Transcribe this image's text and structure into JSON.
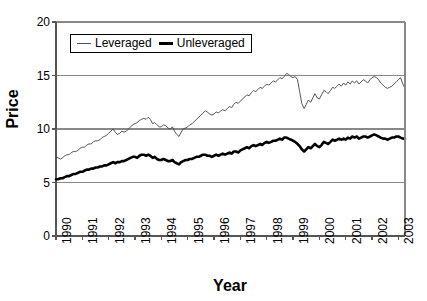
{
  "chart_data": {
    "type": "line",
    "title": "",
    "xlabel": "Year",
    "ylabel": "Price",
    "ylim": [
      0,
      20
    ],
    "yticks": [
      0,
      5,
      10,
      15,
      20
    ],
    "xlim": [
      1990,
      2003.25
    ],
    "xticks": [
      1990,
      1991,
      1992,
      1993,
      1994,
      1995,
      1996,
      1997,
      1998,
      1999,
      2000,
      2001,
      2002,
      2003
    ],
    "xtick_labels": [
      "1990",
      "1991",
      "1992",
      "1993",
      "1994",
      "1995",
      "1996",
      "1997",
      "1998",
      "1999",
      "2000",
      "2001",
      "2002",
      "2003"
    ],
    "grid": "horizontal",
    "legend_position": "top-left-inside",
    "legend_entries": [
      "Leveraged",
      "Unleveraged"
    ],
    "colors": {
      "leveraged": "#444444",
      "unleveraged": "#000000",
      "gridline": "#888888",
      "axis": "#555555",
      "background": "#ffffff"
    },
    "series": [
      {
        "name": "Leveraged",
        "style": "thin",
        "x": [
          1990.0,
          1990.08,
          1990.17,
          1990.25,
          1990.33,
          1990.42,
          1990.5,
          1990.58,
          1990.67,
          1990.75,
          1990.83,
          1990.92,
          1991.0,
          1991.08,
          1991.17,
          1991.25,
          1991.33,
          1991.42,
          1991.5,
          1991.58,
          1991.67,
          1991.75,
          1991.83,
          1991.92,
          1992.0,
          1992.08,
          1992.17,
          1992.25,
          1992.33,
          1992.42,
          1992.5,
          1992.58,
          1992.67,
          1992.75,
          1992.83,
          1992.92,
          1993.0,
          1993.08,
          1993.17,
          1993.25,
          1993.33,
          1993.42,
          1993.5,
          1993.58,
          1993.67,
          1993.75,
          1993.83,
          1993.92,
          1994.0,
          1994.08,
          1994.17,
          1994.25,
          1994.33,
          1994.42,
          1994.5,
          1994.58,
          1994.67,
          1994.75,
          1994.83,
          1994.92,
          1995.0,
          1995.08,
          1995.17,
          1995.25,
          1995.33,
          1995.42,
          1995.5,
          1995.58,
          1995.67,
          1995.75,
          1995.83,
          1995.92,
          1996.0,
          1996.08,
          1996.17,
          1996.25,
          1996.33,
          1996.42,
          1996.5,
          1996.58,
          1996.67,
          1996.75,
          1996.83,
          1996.92,
          1997.0,
          1997.08,
          1997.17,
          1997.25,
          1997.33,
          1997.42,
          1997.5,
          1997.58,
          1997.67,
          1997.75,
          1997.83,
          1997.92,
          1998.0,
          1998.08,
          1998.17,
          1998.25,
          1998.33,
          1998.42,
          1998.5,
          1998.58,
          1998.67,
          1998.75,
          1998.83,
          1998.92,
          1999.0,
          1999.08,
          1999.17,
          1999.25,
          1999.33,
          1999.42,
          1999.5,
          1999.58,
          1999.67,
          1999.75,
          1999.83,
          1999.92,
          2000.0,
          2000.08,
          2000.17,
          2000.25,
          2000.33,
          2000.42,
          2000.5,
          2000.58,
          2000.67,
          2000.75,
          2000.83,
          2000.92,
          2001.0,
          2001.08,
          2001.17,
          2001.25,
          2001.33,
          2001.42,
          2001.5,
          2001.58,
          2001.67,
          2001.75,
          2001.83,
          2001.92,
          2002.0,
          2002.08,
          2002.17,
          2002.25,
          2002.33,
          2002.42,
          2002.5,
          2002.58,
          2002.67,
          2002.75,
          2002.83,
          2002.92,
          2003.0,
          2003.08,
          2003.17,
          2003.25
        ],
        "y": [
          7.4,
          7.3,
          7.2,
          7.3,
          7.5,
          7.6,
          7.6,
          7.8,
          7.9,
          7.9,
          8.0,
          8.2,
          8.3,
          8.3,
          8.5,
          8.6,
          8.6,
          8.8,
          8.9,
          8.9,
          9.0,
          9.2,
          9.3,
          9.4,
          9.6,
          9.8,
          10.0,
          9.7,
          9.5,
          9.6,
          9.8,
          9.7,
          9.8,
          10.0,
          10.2,
          10.4,
          10.5,
          10.6,
          10.8,
          10.9,
          11.0,
          10.9,
          11.1,
          10.9,
          10.5,
          10.6,
          10.4,
          10.2,
          10.2,
          10.4,
          10.3,
          10.1,
          10.0,
          10.2,
          9.8,
          9.5,
          9.3,
          9.7,
          10.0,
          10.1,
          10.2,
          10.4,
          10.5,
          10.7,
          10.9,
          11.1,
          11.3,
          11.5,
          11.7,
          11.6,
          11.4,
          11.3,
          11.4,
          11.6,
          11.5,
          11.7,
          11.8,
          11.7,
          11.9,
          12.1,
          12.0,
          12.3,
          12.5,
          12.4,
          12.6,
          12.8,
          13.0,
          13.2,
          13.1,
          13.4,
          13.6,
          13.5,
          13.7,
          13.9,
          13.8,
          14.0,
          14.2,
          14.1,
          14.3,
          14.5,
          14.4,
          14.6,
          14.8,
          14.7,
          14.9,
          15.2,
          15.1,
          14.9,
          14.8,
          14.9,
          14.6,
          13.5,
          12.4,
          11.9,
          12.3,
          12.7,
          12.5,
          12.9,
          13.3,
          12.9,
          12.8,
          13.2,
          13.6,
          13.5,
          13.3,
          13.6,
          13.9,
          13.8,
          14.0,
          14.2,
          14.0,
          14.3,
          14.1,
          14.4,
          14.2,
          14.5,
          14.3,
          14.5,
          14.2,
          14.4,
          14.6,
          14.5,
          14.3,
          14.6,
          14.8,
          14.9,
          14.8,
          14.6,
          14.3,
          14.1,
          13.9,
          13.8,
          13.9,
          14.0,
          14.2,
          14.4,
          14.6,
          14.8,
          14.2,
          13.8
        ]
      },
      {
        "name": "Unleveraged",
        "style": "thick",
        "x": [
          1990.0,
          1990.08,
          1990.17,
          1990.25,
          1990.33,
          1990.42,
          1990.5,
          1990.58,
          1990.67,
          1990.75,
          1990.83,
          1990.92,
          1991.0,
          1991.08,
          1991.17,
          1991.25,
          1991.33,
          1991.42,
          1991.5,
          1991.58,
          1991.67,
          1991.75,
          1991.83,
          1991.92,
          1992.0,
          1992.08,
          1992.17,
          1992.25,
          1992.33,
          1992.42,
          1992.5,
          1992.58,
          1992.67,
          1992.75,
          1992.83,
          1992.92,
          1993.0,
          1993.08,
          1993.17,
          1993.25,
          1993.33,
          1993.42,
          1993.5,
          1993.58,
          1993.67,
          1993.75,
          1993.83,
          1993.92,
          1994.0,
          1994.08,
          1994.17,
          1994.25,
          1994.33,
          1994.42,
          1994.5,
          1994.58,
          1994.67,
          1994.75,
          1994.83,
          1994.92,
          1995.0,
          1995.08,
          1995.17,
          1995.25,
          1995.33,
          1995.42,
          1995.5,
          1995.58,
          1995.67,
          1995.75,
          1995.83,
          1995.92,
          1996.0,
          1996.08,
          1996.17,
          1996.25,
          1996.33,
          1996.42,
          1996.5,
          1996.58,
          1996.67,
          1996.75,
          1996.83,
          1996.92,
          1997.0,
          1997.08,
          1997.17,
          1997.25,
          1997.33,
          1997.42,
          1997.5,
          1997.58,
          1997.67,
          1997.75,
          1997.83,
          1997.92,
          1998.0,
          1998.08,
          1998.17,
          1998.25,
          1998.33,
          1998.42,
          1998.5,
          1998.58,
          1998.67,
          1998.75,
          1998.83,
          1998.92,
          1999.0,
          1999.08,
          1999.17,
          1999.25,
          1999.33,
          1999.42,
          1999.5,
          1999.58,
          1999.67,
          1999.75,
          1999.83,
          1999.92,
          2000.0,
          2000.08,
          2000.17,
          2000.25,
          2000.33,
          2000.42,
          2000.5,
          2000.58,
          2000.67,
          2000.75,
          2000.83,
          2000.92,
          2001.0,
          2001.08,
          2001.17,
          2001.25,
          2001.33,
          2001.42,
          2001.5,
          2001.58,
          2001.67,
          2001.75,
          2001.83,
          2001.92,
          2002.0,
          2002.08,
          2002.17,
          2002.25,
          2002.33,
          2002.42,
          2002.5,
          2002.58,
          2002.67,
          2002.75,
          2002.83,
          2002.92,
          2003.0,
          2003.08,
          2003.17,
          2003.25
        ],
        "y": [
          5.3,
          5.3,
          5.4,
          5.4,
          5.5,
          5.6,
          5.6,
          5.7,
          5.8,
          5.8,
          5.9,
          6.0,
          6.0,
          6.1,
          6.2,
          6.2,
          6.3,
          6.3,
          6.4,
          6.4,
          6.5,
          6.5,
          6.6,
          6.6,
          6.7,
          6.8,
          6.9,
          6.8,
          6.9,
          6.9,
          7.0,
          7.0,
          7.1,
          7.2,
          7.3,
          7.4,
          7.4,
          7.3,
          7.5,
          7.6,
          7.6,
          7.5,
          7.6,
          7.5,
          7.3,
          7.4,
          7.2,
          7.1,
          7.1,
          7.2,
          7.1,
          7.0,
          7.0,
          7.1,
          6.9,
          6.8,
          6.7,
          6.9,
          7.0,
          7.1,
          7.1,
          7.2,
          7.2,
          7.3,
          7.4,
          7.4,
          7.5,
          7.6,
          7.6,
          7.5,
          7.5,
          7.4,
          7.5,
          7.6,
          7.5,
          7.6,
          7.7,
          7.6,
          7.7,
          7.8,
          7.7,
          7.9,
          7.9,
          7.8,
          8.0,
          8.1,
          8.2,
          8.3,
          8.2,
          8.4,
          8.5,
          8.4,
          8.5,
          8.6,
          8.5,
          8.7,
          8.8,
          8.7,
          8.8,
          8.9,
          8.9,
          9.0,
          9.1,
          9.0,
          9.2,
          9.2,
          9.1,
          9.0,
          8.9,
          8.8,
          8.6,
          8.4,
          8.1,
          7.9,
          8.1,
          8.3,
          8.2,
          8.4,
          8.6,
          8.4,
          8.3,
          8.5,
          8.8,
          8.7,
          8.6,
          8.8,
          9.0,
          8.9,
          9.0,
          9.1,
          9.0,
          9.1,
          9.0,
          9.2,
          9.1,
          9.3,
          9.2,
          9.3,
          9.1,
          9.2,
          9.3,
          9.3,
          9.2,
          9.3,
          9.4,
          9.5,
          9.4,
          9.3,
          9.2,
          9.1,
          9.1,
          9.0,
          9.1,
          9.2,
          9.2,
          9.3,
          9.3,
          9.2,
          9.1,
          9.1
        ]
      }
    ]
  },
  "axes": {
    "y_title": "Price",
    "x_title": "Year"
  },
  "legend": {
    "leveraged_label": "Leveraged",
    "unleveraged_label": "Unleveraged"
  }
}
